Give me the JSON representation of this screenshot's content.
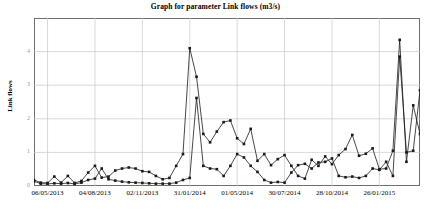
{
  "chart_data": {
    "type": "line",
    "title": "Graph for parameter Link flows (m3/s)",
    "xlabel": "",
    "ylabel": "Link flows",
    "grid": true,
    "legend": "none",
    "ylim": [
      0,
      5
    ],
    "yticks": [
      0,
      1,
      2,
      3,
      4
    ],
    "ytick_labels": [
      "0",
      "1",
      "2",
      "3",
      "4"
    ],
    "xtick_labels": [
      "06/05/2013",
      "04/08/2013",
      "02/11/2013",
      "31/01/2014",
      "01/05/2014",
      "30/07/2014",
      "28/10/2014",
      "26/01/2015"
    ],
    "xtick_indices": [
      2,
      9,
      16,
      23,
      30,
      37,
      44,
      51
    ],
    "n_points": 58,
    "marker": "square",
    "series": [
      {
        "name": "Series 1",
        "color": "#1a1a1a",
        "values": [
          0.18,
          0.1,
          0.09,
          0.28,
          0.1,
          0.3,
          0.09,
          0.15,
          0.4,
          0.6,
          0.25,
          0.28,
          0.46,
          0.52,
          0.55,
          0.52,
          0.44,
          0.42,
          0.3,
          0.2,
          0.24,
          0.6,
          0.95,
          4.1,
          3.25,
          1.55,
          1.3,
          1.62,
          1.9,
          1.95,
          1.42,
          1.25,
          1.7,
          0.75,
          0.95,
          0.62,
          0.8,
          0.92,
          0.6,
          0.3,
          0.22,
          0.78,
          0.6,
          0.88,
          0.65,
          0.92,
          1.1,
          1.52,
          0.9,
          0.96,
          1.12,
          0.5,
          0.52,
          1.05,
          4.35,
          0.72,
          2.4,
          1.55
        ]
      },
      {
        "name": "Series 2",
        "color": "#1a1a1a",
        "values": [
          0.14,
          0.07,
          0.06,
          0.08,
          0.07,
          0.09,
          0.06,
          0.1,
          0.18,
          0.22,
          0.52,
          0.2,
          0.16,
          0.13,
          0.11,
          0.1,
          0.09,
          0.08,
          0.07,
          0.07,
          0.07,
          0.1,
          0.18,
          0.24,
          2.62,
          0.6,
          0.52,
          0.5,
          0.3,
          0.6,
          0.95,
          0.85,
          0.6,
          0.42,
          0.18,
          0.1,
          0.12,
          0.1,
          0.4,
          0.62,
          0.66,
          0.52,
          0.7,
          0.72,
          0.82,
          0.3,
          0.26,
          0.28,
          0.24,
          0.3,
          0.52,
          0.48,
          0.72,
          0.3,
          3.85,
          1.0,
          1.05,
          2.85
        ]
      }
    ]
  }
}
